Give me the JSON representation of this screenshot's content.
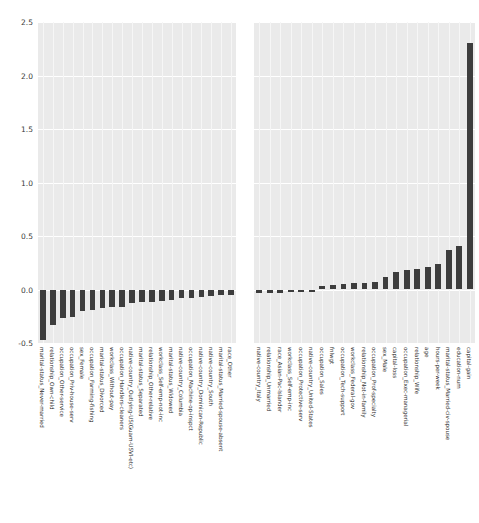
{
  "figure": {
    "type": "grouped-bar-pair",
    "background_color": "#ffffff",
    "panel_background_color": "#eaeaea",
    "bar_color": "#3d3d3d",
    "gridline_color": "#ffffff",
    "width_px": 479,
    "height_px": 523
  },
  "yaxis": {
    "ticks": [
      "2.5",
      "2.0",
      "1.5",
      "1.0",
      "0.5",
      "0.0",
      "-0.5"
    ],
    "tick_values": [
      2.5,
      2.0,
      1.5,
      1.0,
      0.5,
      0.0,
      -0.5
    ],
    "limits": [
      -0.5,
      2.5
    ],
    "label": ""
  },
  "chart_data": [
    {
      "type": "bar",
      "title": "",
      "subtitle": "",
      "xlabel": "",
      "ylabel": "",
      "ylim": [
        -0.5,
        2.5
      ],
      "grid": true,
      "legend": "none",
      "panel": "left",
      "orientation": "vertical",
      "note": "most negative coefficients, ascending toward zero",
      "categories": [
        "marital-status_Never-married",
        "relationship_Own-child",
        "occupation_Other-service",
        "occupation_Priv-house-serv",
        "sex_Female",
        "occupation_Farming-fishing",
        "marital-status_Divorced",
        "workclass_Without-pay",
        "occupation_Handlers-cleaners",
        "native-country_Outlying-US(Guam-USVI-etc)",
        "marital-status_Separated",
        "relationship_Other-relative",
        "workclass_Self-emp-not-inc",
        "marital-status_Widowed",
        "native-country_Columbia",
        "occupation_Machine-op-inspct",
        "native-country_Dominican-Republic",
        "native-country_South",
        "marital-status_Married-spouse-absent",
        "race_Other"
      ],
      "values": [
        -0.47,
        -0.33,
        -0.27,
        -0.26,
        -0.2,
        -0.19,
        -0.17,
        -0.16,
        -0.16,
        -0.13,
        -0.12,
        -0.12,
        -0.11,
        -0.1,
        -0.08,
        -0.08,
        -0.07,
        -0.06,
        -0.05,
        -0.05
      ]
    },
    {
      "type": "bar",
      "title": "",
      "subtitle": "",
      "xlabel": "",
      "ylabel": "",
      "ylim": [
        -0.5,
        2.5
      ],
      "grid": true,
      "legend": "none",
      "panel": "right",
      "orientation": "vertical",
      "note": "near-zero through most positive coefficients, ascending",
      "categories": [
        "native-country_Italy",
        "relationship_Unmarried",
        "race_Asian-Pac-Islander",
        "workclass_Self-emp-inc",
        "occupation_Protective-serv",
        "native-country_United-States",
        "occupation_Sales",
        "fnlwgt",
        "occupation_Tech-support",
        "workclass_Federal-gov",
        "relationship_Not-in-family",
        "occupation_Prof-specialty",
        "sex_Male",
        "capital-loss",
        "occupation_Exec-managerial",
        "relationship_Wife",
        "age",
        "hours-per-week",
        "marital-status_Married-civ-spouse",
        "education-num",
        "capital-gain"
      ],
      "values": [
        -0.03,
        -0.03,
        -0.03,
        -0.02,
        -0.02,
        -0.02,
        0.03,
        0.04,
        0.05,
        0.06,
        0.06,
        0.07,
        0.12,
        0.16,
        0.18,
        0.19,
        0.21,
        0.24,
        0.37,
        0.41,
        2.3
      ]
    }
  ]
}
